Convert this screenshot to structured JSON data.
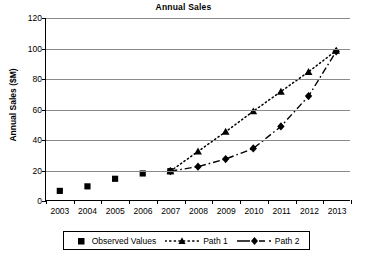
{
  "chart_data": {
    "type": "line",
    "title": "Annual Sales",
    "xlabel": "",
    "ylabel": "Annual Sales ($M)",
    "x": [
      2003,
      2004,
      2005,
      2006,
      2007,
      2008,
      2009,
      2010,
      2011,
      2012,
      2013
    ],
    "categories": [
      "2003",
      "2004",
      "2005",
      "2006",
      "2007",
      "2008",
      "2009",
      "2010",
      "2011",
      "2012",
      "2013"
    ],
    "xlim": [
      2002.5,
      2013.5
    ],
    "ylim": [
      0,
      120
    ],
    "yticks": [
      0,
      20,
      40,
      60,
      80,
      100,
      120
    ],
    "ytick_labels": [
      "0",
      "20",
      "40",
      "60",
      "80",
      "100",
      "120"
    ],
    "grid": "horizontal",
    "legend_position": "bottom",
    "series": [
      {
        "name": "Observed Values",
        "marker": "square",
        "line": "none",
        "color": "#000000",
        "x": [
          2003,
          2004,
          2005,
          2006,
          2007
        ],
        "values": [
          6,
          9,
          14,
          17.5,
          19
        ]
      },
      {
        "name": "Path 1",
        "marker": "triangle",
        "line": "dotted",
        "color": "#000000",
        "x": [
          2007,
          2008,
          2009,
          2010,
          2011,
          2012,
          2013
        ],
        "values": [
          19,
          32,
          45,
          58.5,
          71.5,
          84.5,
          98.5
        ]
      },
      {
        "name": "Path 2",
        "marker": "diamond",
        "line": "dash-dot",
        "color": "#000000",
        "x": [
          2007,
          2008,
          2009,
          2010,
          2011,
          2012,
          2013
        ],
        "values": [
          19,
          22,
          27,
          34,
          48.5,
          68.5,
          98
        ]
      }
    ]
  },
  "legend": {
    "items": [
      {
        "label": "Observed Values",
        "key": "square-marker-key"
      },
      {
        "label": "Path 1",
        "key": "dotted-triangle-key"
      },
      {
        "label": "Path 2",
        "key": "dashdot-diamond-key"
      }
    ]
  }
}
